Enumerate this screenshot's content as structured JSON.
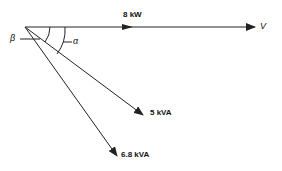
{
  "diagram": {
    "type": "phasor-diagram",
    "labels": {
      "real_power": "8 kW",
      "voltage": "V",
      "apparent_power_1": "5 kVA",
      "apparent_power_2": "6.8 kVA",
      "angle_alpha": "α",
      "angle_beta": "β"
    },
    "colors": {
      "stroke": "#222222",
      "background": "#ffffff"
    }
  }
}
